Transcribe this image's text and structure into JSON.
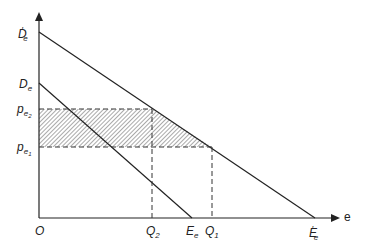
{
  "diagram": {
    "type": "supply-demand price diagram",
    "axes": {
      "origin_label": "O",
      "x_axis_label": "e",
      "y_axis_label": ""
    },
    "curves": [
      {
        "name": "D'e-E'e",
        "start_label": "D",
        "start_sub": "e",
        "start_prime": "′",
        "end_label": "E",
        "end_sub": "e",
        "end_prime": "′"
      },
      {
        "name": "De-Ee",
        "start_label": "D",
        "start_sub": "e",
        "end_label": "E",
        "end_sub": "e"
      }
    ],
    "y_labels": {
      "pe2": {
        "main": "p",
        "sub": "e",
        "subsub": "2"
      },
      "pe1": {
        "main": "p",
        "sub": "e",
        "subsub": "1"
      }
    },
    "x_labels": {
      "q2": {
        "main": "Q",
        "sub": "2"
      },
      "q1": {
        "main": "Q",
        "sub": "1"
      }
    },
    "shaded_region": "hatched area between pe1 and pe2 under D'e-E'e curve",
    "colors": {
      "line": "#222222",
      "hatch": "#444444",
      "background": "#ffffff"
    }
  }
}
